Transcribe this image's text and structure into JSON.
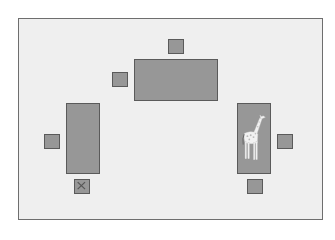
{
  "diagram": {
    "type": "floor-plan",
    "colors": {
      "room_fill": "#efefef",
      "room_border": "#6e6e6e",
      "furniture_fill": "#979797",
      "furniture_border": "#5a5a5a",
      "giraffe": "#f4f4f4"
    },
    "tables": [
      {
        "id": "top",
        "orientation": "horizontal"
      },
      {
        "id": "left",
        "orientation": "vertical"
      },
      {
        "id": "right",
        "orientation": "vertical",
        "contains": "giraffe-icon"
      }
    ],
    "chairs": [
      {
        "id": "top",
        "marked": false
      },
      {
        "id": "top-left",
        "marked": false
      },
      {
        "id": "left",
        "marked": false
      },
      {
        "id": "left-bottom",
        "marked": true,
        "mark": "X"
      },
      {
        "id": "right",
        "marked": false
      },
      {
        "id": "right-bottom",
        "marked": false
      }
    ]
  }
}
